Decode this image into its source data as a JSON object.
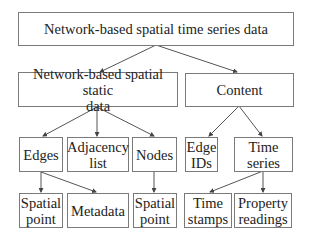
{
  "diagram": {
    "type": "tree",
    "nodes": {
      "root": "Network-based spatial time series data",
      "static": "Network-based spatial static\ndata",
      "content": "Content",
      "edges": "Edges",
      "adjacency": "Adjacency\nlist",
      "nodes": "Nodes",
      "edge_ids": "Edge\nIDs",
      "time_series": "Time\nseries",
      "spatial_point_edges": "Spatial\npoint",
      "metadata": "Metadata",
      "spatial_point_nodes": "Spatial\npoint",
      "time_stamps": "Time\nstamps",
      "property_readings": "Property\nreadings"
    },
    "edges": [
      [
        "root",
        "static"
      ],
      [
        "root",
        "content"
      ],
      [
        "static",
        "edges"
      ],
      [
        "static",
        "adjacency"
      ],
      [
        "static",
        "nodes"
      ],
      [
        "content",
        "edge_ids"
      ],
      [
        "content",
        "time_series"
      ],
      [
        "edges",
        "spatial_point_edges"
      ],
      [
        "edges",
        "metadata"
      ],
      [
        "nodes",
        "spatial_point_nodes"
      ],
      [
        "time_series",
        "time_stamps"
      ],
      [
        "time_series",
        "property_readings"
      ]
    ],
    "colors": {
      "border": "#7a7a7a",
      "arrow": "#555555",
      "text": "#222222"
    }
  }
}
